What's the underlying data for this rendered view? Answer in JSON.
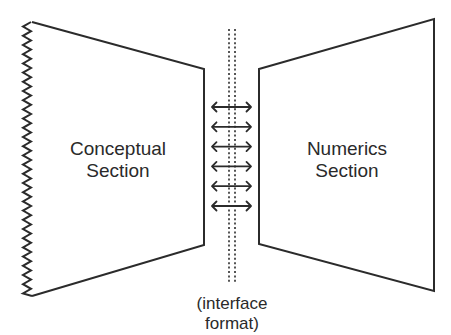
{
  "diagram": {
    "left_section": {
      "line1": "Conceptual",
      "line2": "Section",
      "left_edge_style": "zigzag"
    },
    "right_section": {
      "line1": "Numerics",
      "line2": "Section"
    },
    "interface": {
      "line1": "(interface",
      "line2": "format)",
      "arrow_count": 6,
      "arrow_type": "double-headed"
    },
    "colors": {
      "stroke": "#2b2b2b",
      "text": "#2a2a2a",
      "dotted": "#555555",
      "background": "#ffffff"
    }
  }
}
